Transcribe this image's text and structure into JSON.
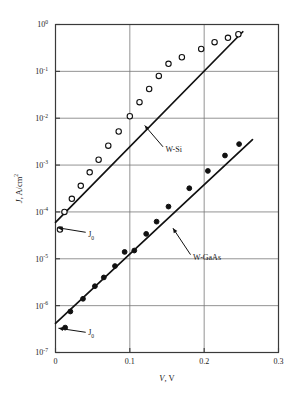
{
  "chart_data": {
    "type": "scatter",
    "title": "",
    "xlabel": "V, V",
    "ylabel": "J, A/cm2",
    "ylabel_parts": {
      "symbol": "J",
      "rest": ", A/cm",
      "exponent": "2"
    },
    "xlabel_parts": {
      "symbol": "V",
      "rest": ", V"
    },
    "xlim": [
      0,
      0.3
    ],
    "ylim": [
      1e-07,
      1
    ],
    "yscale": "log",
    "xscale": "linear",
    "grid": true,
    "legend_position": "inline-annotations",
    "xticks": [
      "0",
      "0.1",
      "0.2",
      "0.3"
    ],
    "xtick_values": [
      0,
      0.1,
      0.2,
      0.3
    ],
    "yticks": [
      "10^0",
      "10^-1",
      "10^-2",
      "10^-3",
      "10^-4",
      "10^-5",
      "10^-6",
      "10^-7"
    ],
    "ytick_mantissa": "10",
    "ytick_exponents": [
      "0",
      "-1",
      "-2",
      "-3",
      "-4",
      "-5",
      "-6",
      "-7"
    ],
    "ytick_values": [
      1,
      0.1,
      0.01,
      0.001,
      0.0001,
      1e-05,
      1e-06,
      1e-07
    ],
    "series": [
      {
        "name": "W-Si",
        "marker": "open-circle",
        "fit_line": {
          "x": [
            0,
            0.252
          ],
          "y": [
            6e-05,
            0.7
          ]
        },
        "points": [
          {
            "x": 0.006,
            "y": 4.2e-05
          },
          {
            "x": 0.012,
            "y": 0.0001
          },
          {
            "x": 0.022,
            "y": 0.00019
          },
          {
            "x": 0.034,
            "y": 0.00036
          },
          {
            "x": 0.046,
            "y": 0.0007
          },
          {
            "x": 0.058,
            "y": 0.0013
          },
          {
            "x": 0.071,
            "y": 0.0026
          },
          {
            "x": 0.085,
            "y": 0.0052
          },
          {
            "x": 0.1,
            "y": 0.011
          },
          {
            "x": 0.113,
            "y": 0.022
          },
          {
            "x": 0.126,
            "y": 0.042
          },
          {
            "x": 0.139,
            "y": 0.08
          },
          {
            "x": 0.152,
            "y": 0.145
          },
          {
            "x": 0.17,
            "y": 0.2
          },
          {
            "x": 0.196,
            "y": 0.3
          },
          {
            "x": 0.214,
            "y": 0.42
          },
          {
            "x": 0.232,
            "y": 0.52
          },
          {
            "x": 0.246,
            "y": 0.62
          }
        ]
      },
      {
        "name": "W-GaAs",
        "marker": "filled-circle",
        "fit_line": {
          "x": [
            0,
            0.265
          ],
          "y": [
            4.2e-07,
            0.0035
          ]
        },
        "points": [
          {
            "x": 0.013,
            "y": 3.4e-07
          },
          {
            "x": 0.02,
            "y": 7.5e-07
          },
          {
            "x": 0.037,
            "y": 1.4e-06
          },
          {
            "x": 0.053,
            "y": 2.6e-06
          },
          {
            "x": 0.065,
            "y": 4e-06
          },
          {
            "x": 0.08,
            "y": 7e-06
          },
          {
            "x": 0.093,
            "y": 1.4e-05
          },
          {
            "x": 0.106,
            "y": 1.5e-05
          },
          {
            "x": 0.122,
            "y": 3.4e-05
          },
          {
            "x": 0.136,
            "y": 6.2e-05
          },
          {
            "x": 0.152,
            "y": 0.00013
          },
          {
            "x": 0.18,
            "y": 0.00032
          },
          {
            "x": 0.205,
            "y": 0.00075
          },
          {
            "x": 0.228,
            "y": 0.0016
          },
          {
            "x": 0.247,
            "y": 0.0028
          }
        ]
      }
    ],
    "annotations": [
      {
        "id": "label-w-si",
        "text": "W-Si",
        "x": 0.148,
        "y": 0.0022,
        "points_to": {
          "x": 0.12,
          "y": 0.007
        }
      },
      {
        "id": "label-w-gaas",
        "text": "W-GaAs",
        "x": 0.185,
        "y": 1.1e-05,
        "points_to": {
          "x": 0.158,
          "y": 4.5e-05
        }
      },
      {
        "id": "j0-upper",
        "text": "J",
        "subscript": "0",
        "x": 0.044,
        "y": 3.3e-05,
        "points_to": {
          "x": 0.003,
          "y": 4.6e-05
        }
      },
      {
        "id": "j0-lower",
        "text": "J",
        "subscript": "0",
        "x": 0.044,
        "y": 2.7e-07,
        "points_to": {
          "x": 0.004,
          "y": 3.3e-07
        }
      }
    ]
  }
}
